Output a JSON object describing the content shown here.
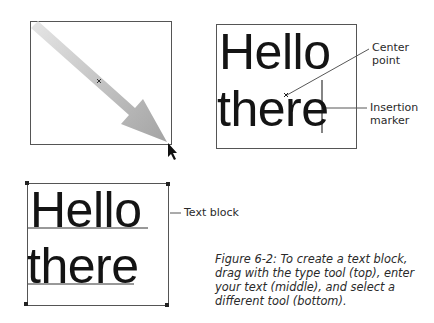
{
  "figure": {
    "caption": "Figure 6-2: To create a text block, drag with the type tool (top), enter your text (middle), and select a different tool (bottom).",
    "panels": [
      {
        "id": "top",
        "description": "Dragging with the type tool",
        "elements": [
          "selection-frame",
          "drag-arrow",
          "center-mark",
          "mouse-pointer-icon"
        ]
      },
      {
        "id": "middle",
        "text_lines": [
          "Hello",
          "there"
        ],
        "callouts": {
          "center_point": "Center\npoint",
          "insertion_marker": "Insertion\nmarker"
        }
      },
      {
        "id": "bottom",
        "text_lines": [
          "Hello",
          "there"
        ],
        "callouts": {
          "text_block": "Text block"
        }
      }
    ]
  },
  "colors": {
    "frame": "#555555",
    "arrow_light": "#dedede",
    "arrow_dark": "#a8a8a8",
    "text": "#141414"
  }
}
